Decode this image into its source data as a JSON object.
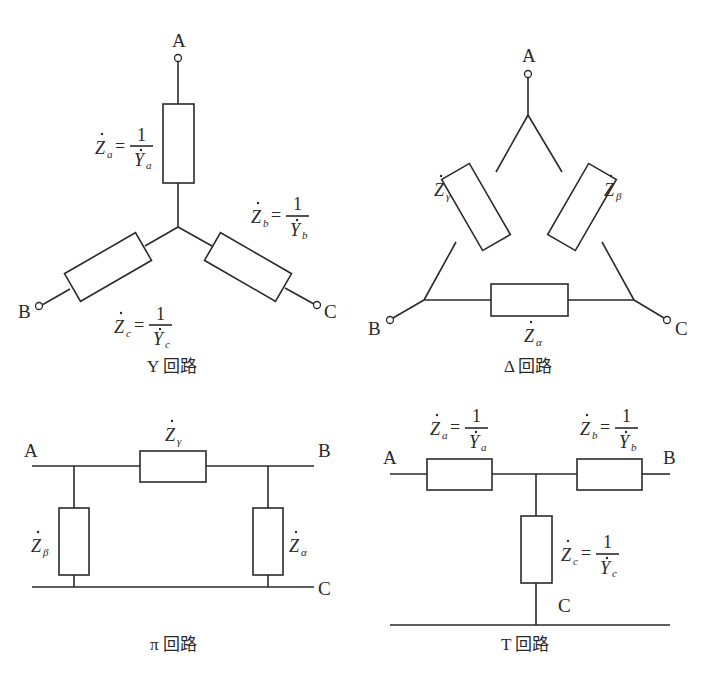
{
  "diagrams": {
    "y_circuit": {
      "caption": "Y 回路",
      "terminals": {
        "a": "A",
        "b": "B",
        "c": "C"
      },
      "za": {
        "symbol": "Z",
        "sub": "a",
        "eq": "=",
        "num": "1",
        "den_symbol": "Y",
        "den_sub": "a"
      },
      "zb": {
        "symbol": "Z",
        "sub": "b",
        "eq": "=",
        "num": "1",
        "den_symbol": "Y",
        "den_sub": "b"
      },
      "zc": {
        "symbol": "Z",
        "sub": "c",
        "eq": "=",
        "num": "1",
        "den_symbol": "Y",
        "den_sub": "c"
      }
    },
    "delta_circuit": {
      "caption": "Δ 回路",
      "terminals": {
        "a": "A",
        "b": "B",
        "c": "C"
      },
      "zgamma": {
        "symbol": "Z",
        "sub": "γ"
      },
      "zbeta": {
        "symbol": "Z",
        "sub": "β"
      },
      "zalpha": {
        "symbol": "Z",
        "sub": "α"
      }
    },
    "pi_circuit": {
      "caption": "π 回路",
      "terminals": {
        "a": "A",
        "b": "B",
        "c": "C"
      },
      "zgamma": {
        "symbol": "Z",
        "sub": "γ"
      },
      "zbeta": {
        "symbol": "Z",
        "sub": "β"
      },
      "zalpha": {
        "symbol": "Z",
        "sub": "α"
      }
    },
    "t_circuit": {
      "caption": "T 回路",
      "terminals": {
        "a": "A",
        "b": "B",
        "c": "C"
      },
      "za": {
        "symbol": "Z",
        "sub": "a",
        "eq": "=",
        "num": "1",
        "den_symbol": "Y",
        "den_sub": "a"
      },
      "zb": {
        "symbol": "Z",
        "sub": "b",
        "eq": "=",
        "num": "1",
        "den_symbol": "Y",
        "den_sub": "b"
      },
      "zc": {
        "symbol": "Z",
        "sub": "c",
        "eq": "=",
        "num": "1",
        "den_symbol": "Y",
        "den_sub": "c"
      }
    }
  }
}
